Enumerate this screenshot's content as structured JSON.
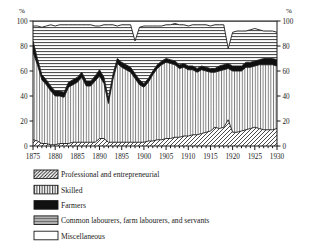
{
  "chart_data": {
    "type": "area",
    "stacked": true,
    "title": "",
    "xlabel": "",
    "ylabel": "%",
    "y_axis_header_left": "%",
    "y_axis_header_right": "%",
    "xlim": [
      1875,
      1930
    ],
    "ylim": [
      0,
      100
    ],
    "yticks": [
      0,
      20,
      40,
      60,
      80,
      100
    ],
    "ytick_labels": [
      "0",
      "20",
      "40",
      "60",
      "80",
      "100"
    ],
    "xticks": [
      1875,
      1880,
      1885,
      1890,
      1895,
      1900,
      1905,
      1910,
      1915,
      1920,
      1925,
      1930
    ],
    "xtick_labels": [
      "1875",
      "1880",
      "1885",
      "1890",
      "1895",
      "1900",
      "1905",
      "1910",
      "1915",
      "1920",
      "1925",
      "1930"
    ],
    "minor_xtick_interval": 1,
    "grid": false,
    "dual_y_axis": true,
    "legend_position": "below",
    "x": [
      1875,
      1876,
      1877,
      1878,
      1879,
      1880,
      1881,
      1882,
      1883,
      1884,
      1885,
      1886,
      1887,
      1888,
      1889,
      1890,
      1891,
      1892,
      1893,
      1894,
      1895,
      1896,
      1897,
      1898,
      1899,
      1900,
      1901,
      1902,
      1903,
      1904,
      1905,
      1906,
      1907,
      1908,
      1909,
      1910,
      1911,
      1912,
      1913,
      1914,
      1915,
      1916,
      1917,
      1918,
      1919,
      1920,
      1921,
      1922,
      1923,
      1924,
      1925,
      1926,
      1927,
      1928,
      1929,
      1930
    ],
    "series": [
      {
        "name": "Professional and entrepreneurial",
        "pattern": "diagonal-hatch",
        "values": [
          5,
          4,
          2,
          2,
          1,
          1,
          2,
          2,
          2,
          3,
          3,
          3,
          3,
          3,
          3,
          6,
          6,
          3,
          3,
          3,
          3,
          3,
          3,
          3,
          3,
          3,
          4,
          4,
          5,
          5,
          6,
          6,
          7,
          7,
          8,
          8,
          9,
          9,
          10,
          11,
          12,
          15,
          14,
          15,
          21,
          11,
          11,
          12,
          13,
          14,
          15,
          14,
          13,
          13,
          13,
          14
        ]
      },
      {
        "name": "Skilled",
        "pattern": "vertical-lines",
        "values": [
          70,
          61,
          51,
          47,
          43,
          39,
          38,
          37,
          45,
          46,
          48,
          52,
          45,
          45,
          49,
          50,
          44,
          31,
          50,
          63,
          60,
          58,
          56,
          51,
          46,
          44,
          47,
          53,
          57,
          60,
          61,
          60,
          58,
          55,
          55,
          53,
          52,
          50,
          51,
          49,
          47,
          44,
          46,
          46,
          41,
          49,
          49,
          48,
          50,
          49,
          49,
          51,
          52,
          52,
          52,
          50
        ]
      },
      {
        "name": "Farmers",
        "pattern": "solid-black",
        "values": [
          9,
          5,
          4,
          4,
          4,
          4,
          4,
          4,
          4,
          4,
          4,
          4,
          4,
          4,
          4,
          5,
          5,
          4,
          4,
          4,
          4,
          4,
          4,
          4,
          4,
          3,
          3,
          3,
          3,
          3,
          3,
          3,
          3,
          3,
          3,
          3,
          3,
          3,
          3,
          3,
          3,
          3,
          4,
          4,
          4,
          4,
          4,
          4,
          4,
          4,
          4,
          4,
          5,
          5,
          5,
          5
        ]
      },
      {
        "name": "Common labourers, farm labourers, and servants",
        "pattern": "horizontal-lines",
        "values": [
          12,
          26,
          38,
          43,
          49,
          52,
          53,
          54,
          46,
          44,
          42,
          38,
          45,
          45,
          40,
          35,
          42,
          59,
          40,
          26,
          30,
          32,
          34,
          26,
          42,
          46,
          42,
          36,
          31,
          28,
          27,
          28,
          30,
          32,
          31,
          32,
          33,
          35,
          33,
          34,
          34,
          35,
          33,
          32,
          12,
          27,
          28,
          28,
          25,
          26,
          26,
          24,
          22,
          22,
          22,
          22
        ]
      },
      {
        "name": "Miscellaneous",
        "pattern": "white",
        "values": [
          4,
          4,
          5,
          4,
          3,
          4,
          3,
          3,
          3,
          3,
          3,
          3,
          3,
          3,
          4,
          4,
          3,
          3,
          3,
          4,
          3,
          3,
          3,
          16,
          5,
          4,
          4,
          4,
          4,
          4,
          3,
          3,
          2,
          3,
          3,
          4,
          3,
          3,
          3,
          3,
          4,
          3,
          3,
          3,
          22,
          9,
          8,
          8,
          8,
          7,
          6,
          7,
          8,
          8,
          8,
          9
        ]
      }
    ]
  },
  "legend": {
    "items": [
      {
        "label": "Professional and entrepreneurial",
        "pattern": "diagonal-hatch"
      },
      {
        "label": "Skilled",
        "pattern": "vertical-lines"
      },
      {
        "label": "Farmers",
        "pattern": "solid-black"
      },
      {
        "label": "Common labourers, farm labourers, and servants",
        "pattern": "horizontal-lines"
      },
      {
        "label": "Miscellaneous",
        "pattern": "white"
      }
    ]
  },
  "colors": {
    "ink": "#1a1a1a",
    "background": "#ffffff",
    "fill_black": "#101010",
    "fill_white": "#ffffff"
  }
}
